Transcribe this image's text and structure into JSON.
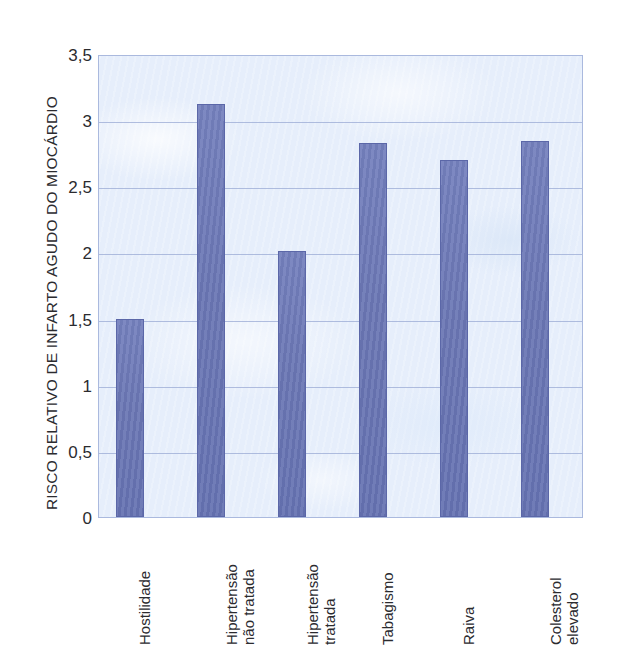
{
  "chart_data": {
    "type": "bar",
    "title": "",
    "xlabel": "",
    "ylabel": "RISCO RELATIVO DE INFARTO AGUDO DO MIOCÁRDIO",
    "categories": [
      "Hostilidade",
      "Hipertensão\nnão tratada",
      "Hipertensão\ntratada",
      "Tabagismo",
      "Raiva",
      "Colesterol\nelevado"
    ],
    "values": [
      1.5,
      3.12,
      2.01,
      2.83,
      2.7,
      2.84
    ],
    "ylim": [
      0,
      3.5
    ],
    "ytick_labels": [
      "3,5",
      "3",
      "2,5",
      "2",
      "1,5",
      "1",
      "0,5",
      "0"
    ],
    "ytick_values": [
      3.5,
      3.0,
      2.5,
      2.0,
      1.5,
      1.0,
      0.5,
      0.0
    ],
    "grid": true,
    "legend": "none",
    "bar_color": "#6b75b8",
    "plot_background": "#e6eefb",
    "gridline_color": "#9aa9d4",
    "frame_color": "#aab9de"
  }
}
